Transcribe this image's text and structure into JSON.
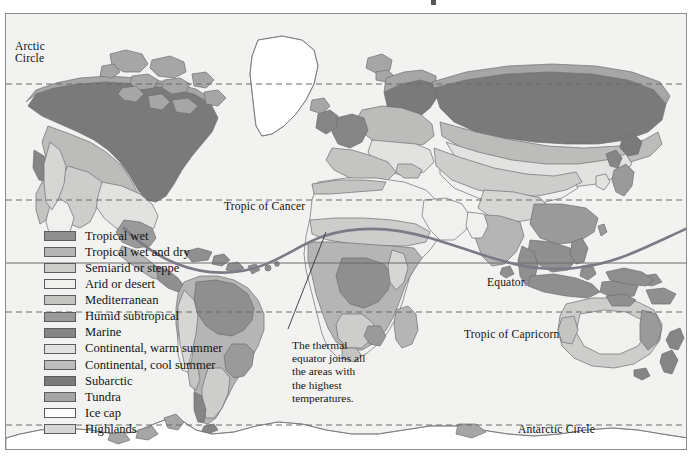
{
  "map": {
    "background_color": "#f2f2f0",
    "border_color": "#8c8c8c",
    "ocean_color": "#f2f2f0",
    "coastline_color": "#6e6e6e"
  },
  "reference_lines": {
    "arctic_circle": {
      "label": "Arctic\nCircle",
      "label_line1": "Arctic",
      "label_line2": "Circle",
      "style": "dashed",
      "y_px": 83
    },
    "tropic_of_cancer": {
      "label": "Tropic of Cancer",
      "style": "dashed",
      "y_px": 199
    },
    "equator": {
      "label": "Equator",
      "style": "solid",
      "y_px": 262
    },
    "tropic_of_capricorn": {
      "label": "Tropic of Capricorn",
      "style": "dashed",
      "y_px": 311
    },
    "antarctic_circle": {
      "label": "Antarctic Circle",
      "style": "dashed",
      "y_px": 424
    },
    "line_color": "#6b6b6b"
  },
  "thermal_equator": {
    "color": "#7d7a86",
    "description": "curved line across the tropics"
  },
  "annotation": {
    "text": "The thermal equator joins all the areas with the highest temperatures.",
    "leader_line_color": "#333333"
  },
  "legend": {
    "title": "",
    "items": [
      {
        "label": "Tropical wet",
        "color": "#8f8f8f"
      },
      {
        "label": "Tropical wet and dry",
        "color": "#b5b5b5"
      },
      {
        "label": "Semiarid or steppe",
        "color": "#cdcdcb"
      },
      {
        "label": "Arid or desert",
        "color": "#f0f0ee"
      },
      {
        "label": "Mediterranean",
        "color": "#c4c4c2"
      },
      {
        "label": "Humid subtropical",
        "color": "#9a9a9a"
      },
      {
        "label": "Marine",
        "color": "#858585"
      },
      {
        "label": "Continental, warm summer",
        "color": "#e2e2e0"
      },
      {
        "label": "Continental, cool summer",
        "color": "#bcbcba"
      },
      {
        "label": "Subarctic",
        "color": "#7a7a7a"
      },
      {
        "label": "Tundra",
        "color": "#a6a6a6"
      },
      {
        "label": "Ice cap",
        "color": "#ffffff"
      },
      {
        "label": "Highlands",
        "color": "#d6d6d4"
      }
    ]
  },
  "chart_data": {
    "type": "map",
    "categories": [
      "Tropical wet",
      "Tropical wet and dry",
      "Semiarid or steppe",
      "Arid or desert",
      "Mediterranean",
      "Humid subtropical",
      "Marine",
      "Continental, warm summer",
      "Continental, cool summer",
      "Subarctic",
      "Tundra",
      "Ice cap",
      "Highlands"
    ],
    "colors": [
      "#8f8f8f",
      "#b5b5b5",
      "#cdcdcb",
      "#f0f0ee",
      "#c4c4c2",
      "#9a9a9a",
      "#858585",
      "#e2e2e0",
      "#bcbcba",
      "#7a7a7a",
      "#a6a6a6",
      "#ffffff",
      "#d6d6d4"
    ],
    "annotations": [
      "The thermal equator joins all the areas with the highest temperatures."
    ],
    "reference_lines": [
      "Arctic Circle",
      "Tropic of Cancer",
      "Equator",
      "Tropic of Capricorn",
      "Antarctic Circle"
    ],
    "legend_position": "left"
  }
}
